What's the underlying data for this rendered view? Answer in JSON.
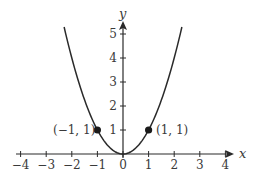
{
  "chart_data": {
    "type": "line",
    "title": "",
    "xlabel": "x",
    "ylabel": "y",
    "function": "y = x^2",
    "xlim": [
      -4.2,
      4.4
    ],
    "ylim": [
      0,
      5.5
    ],
    "grid": false,
    "legend": null,
    "x_ticks": [
      -4,
      -3,
      -2,
      -1,
      0,
      1,
      2,
      3,
      4
    ],
    "x_tick_labels": [
      "−4",
      "−3",
      "−2",
      "−1",
      "0",
      "1",
      "2",
      "3",
      "4"
    ],
    "y_ticks": [
      1,
      2,
      3,
      4,
      5
    ],
    "y_tick_labels": [
      "1",
      "2",
      "3",
      "4",
      "5"
    ],
    "series": [
      {
        "name": "parabola",
        "x": [
          -2.3,
          -2,
          -1.5,
          -1,
          -0.5,
          0,
          0.5,
          1,
          1.5,
          2,
          2.3
        ],
        "y": [
          5.29,
          4,
          2.25,
          1,
          0.25,
          0,
          0.25,
          1,
          2.25,
          4,
          5.29
        ],
        "color": "#2a2a2a"
      }
    ],
    "annotations": [
      {
        "x": -1,
        "y": 1,
        "label": "(−1, 1)",
        "marker": "filled-circle",
        "label_side": "left"
      },
      {
        "x": 1,
        "y": 1,
        "label": "(1, 1)",
        "marker": "filled-circle",
        "label_side": "right"
      }
    ]
  },
  "labels": {
    "x_axis": "x",
    "y_axis": "y",
    "point_left": "(−1, 1)",
    "point_right": "(1, 1)",
    "x_ticks": [
      "−4",
      "−3",
      "−2",
      "−1",
      "0",
      "1",
      "2",
      "3",
      "4"
    ],
    "y_ticks": [
      "1",
      "2",
      "3",
      "4",
      "5"
    ]
  }
}
